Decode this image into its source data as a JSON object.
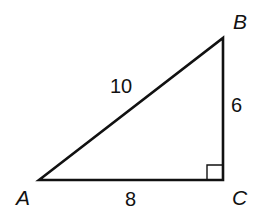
{
  "diagram": {
    "type": "right-triangle",
    "vertices": {
      "A": {
        "label": "A"
      },
      "B": {
        "label": "B"
      },
      "C": {
        "label": "C"
      }
    },
    "sides": {
      "AB": {
        "label": "10"
      },
      "BC": {
        "label": "6"
      },
      "AC": {
        "label": "8"
      }
    },
    "right_angle_at": "C",
    "stroke_color": "#111111"
  }
}
